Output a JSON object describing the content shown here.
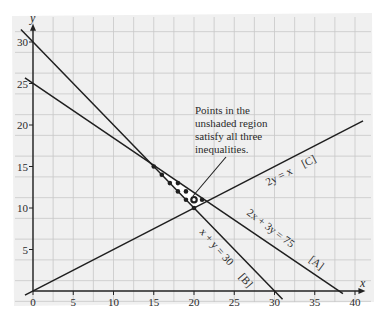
{
  "chart_data": {
    "type": "line",
    "title": "",
    "xlabel": "x",
    "ylabel": "y",
    "xlim": [
      0,
      40
    ],
    "ylim": [
      0,
      30
    ],
    "grid": true,
    "grid_step": 2.5,
    "x_ticks": [
      0,
      5,
      10,
      15,
      20,
      25,
      30,
      35,
      40
    ],
    "y_ticks": [
      5,
      10,
      15,
      20,
      25,
      30
    ],
    "x_tick_labels": [
      "0",
      "5",
      "10",
      "15",
      "20",
      "25",
      "30",
      "35",
      "40"
    ],
    "y_tick_labels": [
      "5",
      "10",
      "15",
      "20",
      "25",
      "30"
    ],
    "series": [
      {
        "name": "2x + 3y = 75",
        "tag": "[A]",
        "label": "2x + 3y = 75   [A]",
        "x": [
          -1,
          38.5
        ],
        "y": [
          25.67,
          -0.33
        ]
      },
      {
        "name": "x + y = 30",
        "tag": "[B]",
        "label": "x + y = 30   [B]",
        "x": [
          -1.5,
          31
        ],
        "y": [
          31.5,
          -1
        ]
      },
      {
        "name": "2y = x",
        "tag": "[C]",
        "label": "2y = x   [C]",
        "x": [
          -1,
          41
        ],
        "y": [
          -0.5,
          20.5
        ]
      }
    ],
    "feasible_region": {
      "vertices": [
        [
          15,
          15
        ],
        [
          20,
          10
        ],
        [
          21.43,
          10.71
        ]
      ],
      "shaded": false
    },
    "points": [
      {
        "x": 15,
        "y": 15,
        "style": "filled"
      },
      {
        "x": 16,
        "y": 14,
        "style": "filled"
      },
      {
        "x": 17,
        "y": 13,
        "style": "filled"
      },
      {
        "x": 18,
        "y": 12,
        "style": "filled"
      },
      {
        "x": 19,
        "y": 11,
        "style": "filled"
      },
      {
        "x": 20,
        "y": 10,
        "style": "filled"
      },
      {
        "x": 18,
        "y": 13,
        "style": "filled"
      },
      {
        "x": 19,
        "y": 12,
        "style": "filled"
      },
      {
        "x": 21,
        "y": 11,
        "style": "filled"
      },
      {
        "x": 20,
        "y": 11,
        "style": "open"
      }
    ],
    "annotations": [
      {
        "text": "Points in the unshaded region satisfy all three inequalities.",
        "points_to": [
          20,
          11
        ]
      }
    ]
  },
  "annotation": {
    "line1": "Points in the",
    "line2": "unshaded region",
    "line3": "satisfy all three",
    "line4": "inequalities."
  },
  "axes": {
    "x_label": "x",
    "y_label": "y"
  },
  "lines": {
    "A": {
      "eq": "2x + 3y = 75",
      "tag": "[A]"
    },
    "B": {
      "eq": "x + y = 30",
      "tag": "[B]"
    },
    "C": {
      "eq": "2y = x",
      "tag": "[C]"
    }
  },
  "colors": {
    "paper": "#f1f1f1",
    "grid": "#c9c9c9",
    "line": "#1f1f1f",
    "shade": "#d9d9d9"
  }
}
